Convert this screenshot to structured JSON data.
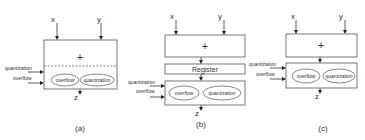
{
  "figure": {
    "panels": [
      {
        "id": "a",
        "caption": "(a)",
        "inputs": {
          "x": "x",
          "y": "y"
        },
        "adder_symbol": "+",
        "side_inputs": {
          "quantization": "quantization",
          "overflow": "overflow"
        },
        "ellipses": {
          "left": "overflow",
          "right": "quantization"
        },
        "output": "z",
        "separator": "dashed"
      },
      {
        "id": "b",
        "caption": "(b)",
        "inputs": {
          "x": "x",
          "y": "y"
        },
        "adder_symbol": "+",
        "register_label": "Register",
        "side_inputs": {
          "quantization": "quantization",
          "overflow": "overflow"
        },
        "ellipses": {
          "left": "overflow",
          "right": "quantization"
        },
        "output": "z"
      },
      {
        "id": "c",
        "caption": "(c)",
        "inputs": {
          "x": "x",
          "y": "y"
        },
        "adder_symbol": "+",
        "side_inputs": {
          "quantization": "quantization",
          "overflow": "overflow"
        },
        "ellipses": {
          "left": "overflow",
          "right": "quantization"
        },
        "output": "z"
      }
    ],
    "colors": {
      "stroke": "#555555",
      "text": "#333333",
      "arrow": "#222222",
      "background": "#ffffff"
    }
  }
}
